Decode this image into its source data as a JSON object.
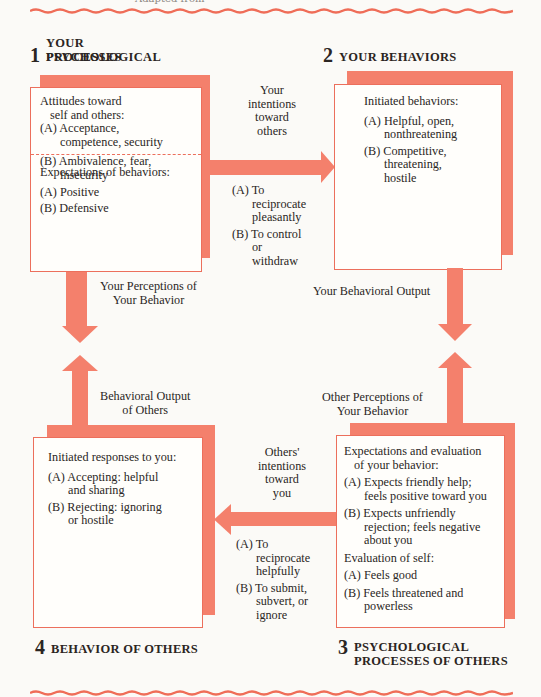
{
  "caption": "Adapted from",
  "colors": {
    "accent": "#f4806c",
    "border": "#ec6f5c",
    "background": "#fbfaf7"
  },
  "quadrants": {
    "q1": {
      "number": "1",
      "title_line1": "YOUR PSYCHOLOGICAL",
      "title_line2": "PROCESSES",
      "section1": {
        "header_line1": "Attitudes toward",
        "header_line2": "self and others:",
        "items": [
          {
            "label": "(A)",
            "line1": "Acceptance,",
            "line2": "competence, security"
          },
          {
            "label": "(B)",
            "line1": "Ambivalence, fear,",
            "line2": "insecurity"
          }
        ]
      },
      "section2": {
        "header": "Expectations of behaviors:",
        "items": [
          {
            "label": "(A)",
            "line1": "Positive"
          },
          {
            "label": "(B)",
            "line1": "Defensive"
          }
        ]
      }
    },
    "q2": {
      "number": "2",
      "title": "YOUR BEHAVIORS",
      "header": "Initiated behaviors:",
      "items": [
        {
          "label": "(A)",
          "line1": "Helpful, open,",
          "line2": "nonthreatening"
        },
        {
          "label": "(B)",
          "line1": "Competitive,",
          "line2": "threatening,",
          "line3": "hostile"
        }
      ]
    },
    "q3": {
      "number": "3",
      "title_line1": "PSYCHOLOGICAL",
      "title_line2": "PROCESSES OF OTHERS",
      "section1": {
        "header_line1": "Expectations and evaluation",
        "header_line2": "of your behavior:",
        "items": [
          {
            "label": "(A)",
            "line1": "Expects friendly help;",
            "line2": "feels positive toward you"
          },
          {
            "label": "(B)",
            "line1": "Expects unfriendly",
            "line2": "rejection; feels negative",
            "line3": "about you"
          }
        ]
      },
      "section2": {
        "header": "Evaluation of self:",
        "items": [
          {
            "label": "(A)",
            "line1": "Feels good"
          },
          {
            "label": "(B)",
            "line1": "Feels threatened and",
            "line2": "powerless"
          }
        ]
      }
    },
    "q4": {
      "number": "4",
      "title": "BEHAVIOR OF OTHERS",
      "header": "Initiated responses to you:",
      "items": [
        {
          "label": "(A)",
          "line1": "Accepting: helpful",
          "line2": "and sharing"
        },
        {
          "label": "(B)",
          "line1": "Rejecting: ignoring",
          "line2": "or hostile"
        }
      ]
    }
  },
  "arrows": {
    "top": {
      "label_lines": [
        "Your",
        "intentions",
        "toward",
        "others"
      ],
      "options": [
        {
          "label": "(A)",
          "line1": "To",
          "line2": "reciprocate",
          "line3": "pleasantly"
        },
        {
          "label": "(B)",
          "line1": "To control",
          "line2": "or",
          "line3": "withdraw"
        }
      ]
    },
    "left_down": {
      "line1": "Your Perceptions of",
      "line2": "Your Behavior"
    },
    "right_down": {
      "line1": "Your Behavioral Output"
    },
    "left_up": {
      "line1": "Behavioral Output",
      "line2": "of Others"
    },
    "right_up": {
      "line1": "Other Perceptions of",
      "line2": "Your Behavior"
    },
    "bottom": {
      "label_lines": [
        "Others'",
        "intentions",
        "toward",
        "you"
      ],
      "options": [
        {
          "label": "(A)",
          "line1": "To",
          "line2": "reciprocate",
          "line3": "helpfully"
        },
        {
          "label": "(B)",
          "line1": "To submit,",
          "line2": "subvert, or",
          "line3": "ignore"
        }
      ]
    }
  }
}
